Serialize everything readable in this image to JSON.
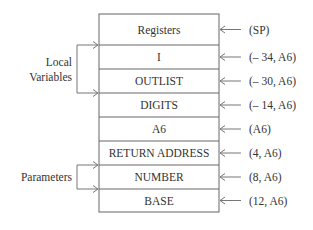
{
  "diagram": {
    "cells": [
      {
        "label": "Registers",
        "address": "(SP)"
      },
      {
        "label": "I",
        "address": "(– 34, A6)"
      },
      {
        "label": "OUTLIST",
        "address": "(– 30, A6)"
      },
      {
        "label": "DIGITS",
        "address": "(– 14, A6)"
      },
      {
        "label": "A6",
        "address": "(A6)"
      },
      {
        "label": "RETURN ADDRESS",
        "address": "(4, A6)"
      },
      {
        "label": "NUMBER",
        "address": "(8, A6)"
      },
      {
        "label": "BASE",
        "address": "(12, A6)"
      }
    ],
    "groups": [
      {
        "label_lines": [
          "Local",
          "Variables"
        ],
        "from_cell": 1,
        "to_cell": 3
      },
      {
        "label_lines": [
          "Parameters"
        ],
        "from_cell": 6,
        "to_cell": 7
      }
    ]
  }
}
